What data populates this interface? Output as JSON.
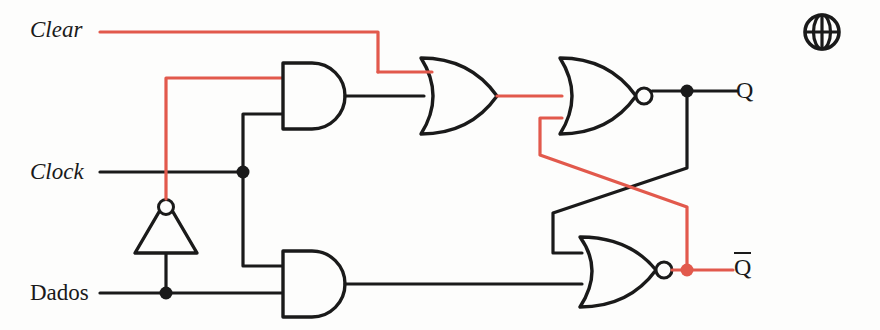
{
  "diagram": {
    "type": "logic-circuit",
    "background_color": "#fdfdfc",
    "wire_colors": {
      "default": "#1a1a1a",
      "highlight": "#e2594c"
    },
    "inputs": [
      {
        "id": "clear",
        "label": "Clear",
        "style": "italic",
        "wire_color": "#e2594c",
        "y": 32
      },
      {
        "id": "clock",
        "label": "Clock",
        "style": "italic",
        "wire_color": "#1a1a1a",
        "y": 172
      },
      {
        "id": "dados",
        "label": "Dados",
        "style": "upright",
        "wire_color": "#1a1a1a",
        "y": 293
      }
    ],
    "outputs": [
      {
        "id": "q",
        "label": "Q",
        "overline": false,
        "wire_color": "#1a1a1a",
        "y": 91
      },
      {
        "id": "qbar",
        "label": "Q",
        "overline": true,
        "wire_color": "#e2594c",
        "y": 270
      }
    ],
    "gates": [
      {
        "id": "inverter",
        "type": "NOT",
        "label": "inverter-gate",
        "inverted_output": true
      },
      {
        "id": "and-top",
        "type": "AND",
        "label": "and-gate-top",
        "inverted_output": false
      },
      {
        "id": "and-bottom",
        "type": "AND",
        "label": "and-gate-bottom",
        "inverted_output": false
      },
      {
        "id": "or-top",
        "type": "OR",
        "label": "or-gate-top",
        "inverted_output": false
      },
      {
        "id": "nor-top",
        "type": "NOR",
        "label": "nor-gate-top",
        "inverted_output": true
      },
      {
        "id": "nor-bottom",
        "type": "NOR",
        "label": "nor-gate-bottom",
        "inverted_output": true
      }
    ],
    "junctions": [
      {
        "id": "clock-tap",
        "x": 243,
        "y": 172,
        "color": "#1a1a1a"
      },
      {
        "id": "dados-tap",
        "x": 166,
        "y": 293,
        "color": "#1a1a1a"
      },
      {
        "id": "q-tap",
        "x": 687,
        "y": 91,
        "color": "#1a1a1a"
      },
      {
        "id": "qbar-tap",
        "x": 687,
        "y": 270,
        "color": "#e2594c"
      }
    ],
    "icons": [
      {
        "id": "globe",
        "name": "globe-icon",
        "glyph": "globe"
      }
    ]
  }
}
